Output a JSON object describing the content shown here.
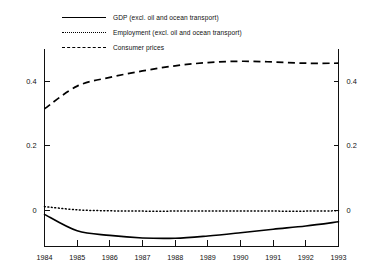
{
  "chart_data": {
    "type": "line",
    "title": "",
    "subtitle": "",
    "xlabel": "",
    "ylabel": "",
    "x": [
      1984,
      1985,
      1986,
      1987,
      1988,
      1989,
      1990,
      1991,
      1992,
      1993
    ],
    "categories": [
      "1984",
      "1985",
      "1986",
      "1987",
      "1988",
      "1989",
      "1990",
      "1991",
      "1992",
      "1993"
    ],
    "xlim": [
      1984,
      1993
    ],
    "ylim": [
      -0.11,
      0.5
    ],
    "y_ticks": [
      0,
      0.2,
      0.4
    ],
    "y_tick_labels": [
      "0",
      "0.2",
      "0.4"
    ],
    "y_axis_right_ticks": [
      0,
      0.2,
      0.4
    ],
    "y_axis_right_tick_labels": [
      "0",
      "0.2",
      "0.4"
    ],
    "grid": false,
    "legend_position": "top-left",
    "series": [
      {
        "name": "GDP (excl. oil and ocean transport)",
        "style": "solid",
        "color": "#000000",
        "values": [
          -0.012,
          -0.063,
          -0.077,
          -0.085,
          -0.086,
          -0.079,
          -0.069,
          -0.058,
          -0.048,
          -0.035
        ]
      },
      {
        "name": "Employment (excl. oil and ocean transport)",
        "style": "dotted",
        "color": "#000000",
        "values": [
          0.012,
          0.002,
          -0.001,
          -0.002,
          -0.002,
          -0.002,
          -0.002,
          -0.002,
          -0.002,
          -0.001
        ]
      },
      {
        "name": "Consumer prices",
        "style": "dashed",
        "color": "#000000",
        "values": [
          0.315,
          0.385,
          0.412,
          0.432,
          0.448,
          0.458,
          0.462,
          0.46,
          0.456,
          0.456
        ]
      }
    ]
  },
  "legend": {
    "items": [
      {
        "label": "GDP (excl. oil and ocean transport)",
        "style": "solid"
      },
      {
        "label": "Employment (excl. oil and ocean transport)",
        "style": "dotted"
      },
      {
        "label": "Consumer prices",
        "style": "dashed"
      }
    ]
  },
  "axes": {
    "left_labels": [
      "0.4",
      "0.2",
      "0"
    ],
    "right_labels": [
      "0.4",
      "0.2",
      "0"
    ],
    "x_labels": [
      "1984",
      "1985",
      "1986",
      "1987",
      "1988",
      "1989",
      "1990",
      "1991",
      "1992",
      "1993"
    ]
  }
}
